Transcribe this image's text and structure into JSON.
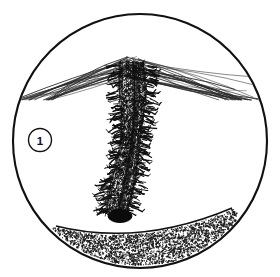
{
  "figure": {
    "kind": "circular-line-illustration",
    "style": "black-and-white stipple and hatch engraving",
    "frame": {
      "shape": "circle",
      "center_x": 140,
      "center_y": 141,
      "radius": 127,
      "stroke_color": "#111111",
      "stroke_width": 2.1,
      "fill_color": "#ffffff"
    },
    "callout": {
      "label": "1",
      "center_x": 40,
      "center_y": 140,
      "radius": 11.5,
      "stroke_color": "#111111",
      "text_color": "#111111"
    },
    "subject": {
      "name": "spiky-vertical-stem",
      "description": "dense thorny column rising from stippled ground",
      "top_x": 132,
      "top_y": 62,
      "bottom_x": 119,
      "bottom_y": 214,
      "top_half_width": 17,
      "bottom_half_width": 15,
      "ink_color": "#111111"
    },
    "base_bulb": {
      "name": "dark-basal-swelling",
      "center_x": 120,
      "center_y": 216,
      "rx": 12,
      "ry": 6.5,
      "fill_color": "#0b0b0b"
    },
    "radiating_lines": {
      "name": "fine-fan-lines",
      "count": 46,
      "origin_x": 131,
      "origin_y": 66,
      "stroke_color": "#2a2a2a",
      "stroke_width": 0.55,
      "spread_top_y": 34,
      "spread_bottom_y": 82
    },
    "ground": {
      "name": "stippled-substrate",
      "texture": "stipple",
      "dot_count": 2600,
      "left_x": 56,
      "left_y": 226,
      "apex_x": 140,
      "apex_y": 247,
      "right_x": 232,
      "right_y": 208,
      "surface_stroke": "#111111",
      "dot_color": "#1a1a1a"
    }
  },
  "colors": {
    "ink": "#111111",
    "hairline": "#2a2a2a",
    "background": "#ffffff",
    "stipple": "#1a1a1a"
  }
}
